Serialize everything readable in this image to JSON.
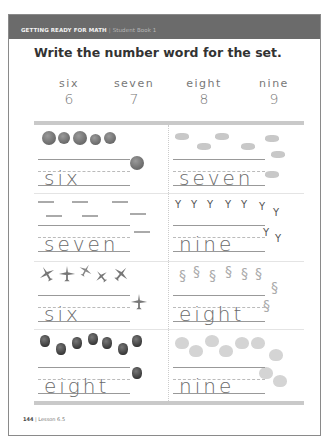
{
  "header": {
    "book_title": "GETTING READY FOR MATH",
    "separator": "|",
    "book_subtitle": "Student Book 1"
  },
  "instruction": "Write the number word for the set.",
  "number_key": [
    {
      "word": "six",
      "digit": "6"
    },
    {
      "word": "seven",
      "digit": "7"
    },
    {
      "word": "eight",
      "digit": "8"
    },
    {
      "word": "nine",
      "digit": "9"
    }
  ],
  "exercises": [
    {
      "object": "balls",
      "count": 6,
      "answer": "six"
    },
    {
      "object": "rabbits",
      "count": 7,
      "answer": "seven"
    },
    {
      "object": "sticks",
      "count": 7,
      "answer": "seven"
    },
    {
      "object": "sprouts",
      "count": 9,
      "answer": "nine"
    },
    {
      "object": "airplanes",
      "count": 6,
      "answer": "six"
    },
    {
      "object": "worms",
      "count": 8,
      "answer": "eight"
    },
    {
      "object": "berries",
      "count": 8,
      "answer": "eight"
    },
    {
      "object": "ducklings",
      "count": 9,
      "answer": "nine"
    }
  ],
  "footer": {
    "page_number": "144",
    "separator": "|",
    "lesson": "Lesson 6.5"
  }
}
